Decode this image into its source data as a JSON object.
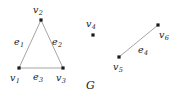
{
  "figure": {
    "name": "graph-G",
    "caption": "G",
    "width": 181,
    "height": 99,
    "background_color": "#ffffff",
    "vertex_color": "#1a1a1a",
    "edge_color": "#9a9a9a",
    "label_color": "#1a1a1a"
  },
  "vertices": [
    {
      "id": "v1",
      "base": "v",
      "sub": "1",
      "x": 19,
      "y": 68,
      "label_x": 10,
      "label_y": 73
    },
    {
      "id": "v2",
      "base": "v",
      "sub": "2",
      "x": 41,
      "y": 20,
      "label_x": 33,
      "label_y": 5
    },
    {
      "id": "v3",
      "base": "v",
      "sub": "3",
      "x": 63,
      "y": 68,
      "label_x": 56,
      "label_y": 73
    },
    {
      "id": "v4",
      "base": "v",
      "sub": "4",
      "x": 93,
      "y": 35,
      "label_x": 86,
      "label_y": 19
    },
    {
      "id": "v5",
      "base": "v",
      "sub": "5",
      "x": 119,
      "y": 57,
      "label_x": 113,
      "label_y": 62
    },
    {
      "id": "v6",
      "base": "v",
      "sub": "6",
      "x": 158,
      "y": 25,
      "label_x": 159,
      "label_y": 30
    }
  ],
  "edges": [
    {
      "id": "e1",
      "base": "e",
      "sub": "1",
      "from": "v1",
      "to": "v2",
      "label_x": 14,
      "label_y": 37
    },
    {
      "id": "e2",
      "base": "e",
      "sub": "2",
      "from": "v2",
      "to": "v3",
      "label_x": 52,
      "label_y": 37
    },
    {
      "id": "e3",
      "base": "e",
      "sub": "3",
      "from": "v1",
      "to": "v3",
      "label_x": 33,
      "label_y": 72
    },
    {
      "id": "e4",
      "base": "e",
      "sub": "4",
      "from": "v5",
      "to": "v6",
      "label_x": 138,
      "label_y": 45
    }
  ],
  "caption": {
    "text": "G",
    "x": 86,
    "y": 80
  }
}
